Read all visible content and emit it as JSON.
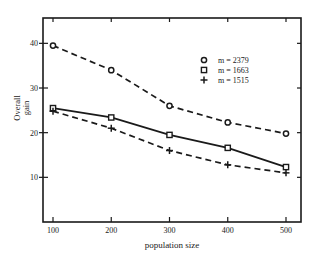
{
  "chart_data": {
    "type": "line",
    "title": "",
    "xlabel": "population size",
    "ylabel": "Overall gain",
    "ylabel_lines": [
      "Overall",
      "gain"
    ],
    "x": [
      100,
      200,
      300,
      400,
      500
    ],
    "xticks": [
      100,
      200,
      300,
      400,
      500
    ],
    "yticks": [
      10,
      20,
      30,
      40
    ],
    "xlim": [
      83,
      530
    ],
    "ylim": [
      0,
      45.5
    ],
    "grid": false,
    "legend_position": "upper right (inside)",
    "series": [
      {
        "name": "m = 2379",
        "marker": "circle",
        "line": "dashed",
        "values": [
          39.5,
          34.0,
          26.0,
          22.3,
          19.8
        ]
      },
      {
        "name": "m = 1663",
        "marker": "square",
        "line": "solid",
        "values": [
          25.5,
          23.4,
          19.5,
          16.6,
          12.3
        ]
      },
      {
        "name": "m = 1515",
        "marker": "plus",
        "line": "dashed",
        "values": [
          24.8,
          21.0,
          16.0,
          12.8,
          11.0
        ]
      }
    ]
  },
  "colors": {
    "ink": "#1a1a1a",
    "background": "#ffffff"
  }
}
